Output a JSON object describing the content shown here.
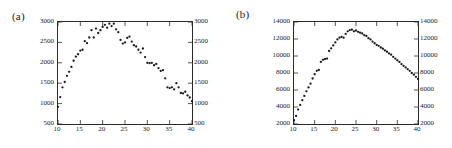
{
  "figure": {
    "background": "#ffffff",
    "point_color": "#1a1a1a",
    "axis_color": "#2b2b2b"
  },
  "panels": [
    {
      "id": "a",
      "label": "(a)"
    },
    {
      "id": "b",
      "label": "(b)"
    }
  ],
  "chart_data": [
    {
      "type": "scatter",
      "title": "(a)",
      "xlabel": "",
      "ylabel": "",
      "xlim": [
        10,
        40
      ],
      "ylim": [
        500,
        3000
      ],
      "xticks": [
        10,
        15,
        20,
        25,
        30,
        35,
        40
      ],
      "yticks": [
        500,
        1000,
        1500,
        2000,
        2500,
        3000
      ],
      "xticklabels": [
        "10",
        "15",
        "20",
        "25",
        "30",
        "35",
        "40"
      ],
      "yticklabels": [
        "500",
        "1000",
        "1500",
        "2000",
        "2500",
        "3000"
      ],
      "grid": false,
      "legend": null,
      "mirrored_y_axis": true,
      "marker": "filled-circle",
      "x": [
        10.0,
        10.5,
        11.0,
        11.5,
        12.0,
        12.5,
        13.0,
        13.5,
        14.0,
        14.5,
        15.0,
        15.5,
        16.0,
        16.5,
        17.0,
        17.5,
        18.0,
        18.5,
        19.0,
        19.5,
        20.0,
        20.5,
        21.0,
        21.5,
        22.0,
        22.5,
        23.0,
        23.5,
        24.0,
        24.5,
        25.0,
        25.5,
        26.0,
        26.5,
        27.0,
        27.5,
        28.0,
        28.5,
        29.0,
        29.5,
        30.0,
        30.5,
        31.0,
        31.5,
        32.0,
        32.5,
        33.0,
        33.5,
        34.0,
        34.5,
        35.0,
        35.5,
        36.0,
        36.5,
        37.0,
        37.5,
        38.0,
        38.5,
        39.0,
        39.5,
        40.0
      ],
      "y": [
        920,
        1160,
        1400,
        1530,
        1680,
        1780,
        1900,
        2050,
        2150,
        2210,
        2300,
        2320,
        2530,
        2480,
        2620,
        2800,
        2620,
        2840,
        2730,
        2800,
        2880,
        2930,
        2860,
        2960,
        2900,
        2960,
        2820,
        2750,
        2560,
        2470,
        2500,
        2610,
        2640,
        2520,
        2430,
        2400,
        2320,
        2250,
        2350,
        2140,
        2000,
        1990,
        2000,
        1940,
        1970,
        1870,
        1800,
        1820,
        1620,
        1400,
        1380,
        1400,
        1350,
        1500,
        1400,
        1260,
        1250,
        1290,
        1200,
        1150,
        1060
      ]
    },
    {
      "type": "scatter",
      "title": "(b)",
      "xlabel": "",
      "ylabel": "",
      "xlim": [
        10,
        40
      ],
      "ylim": [
        2000,
        14000
      ],
      "xticks": [
        10,
        15,
        20,
        25,
        30,
        35,
        40
      ],
      "yticks": [
        2000,
        4000,
        6000,
        8000,
        10000,
        12000,
        14000
      ],
      "xticklabels": [
        "10",
        "15",
        "20",
        "25",
        "30",
        "35",
        "40"
      ],
      "yticklabels": [
        "2000",
        "4000",
        "6000",
        "8000",
        "10000",
        "12000",
        "14000"
      ],
      "grid": false,
      "legend": null,
      "mirrored_y_axis": true,
      "marker": "filled-circle",
      "x": [
        10.0,
        10.5,
        11.0,
        11.5,
        12.0,
        12.5,
        13.0,
        13.5,
        14.0,
        14.5,
        15.0,
        15.5,
        16.0,
        16.5,
        17.0,
        17.5,
        18.0,
        18.5,
        19.0,
        19.5,
        20.0,
        20.5,
        21.0,
        21.5,
        22.0,
        22.5,
        23.0,
        23.5,
        24.0,
        24.5,
        25.0,
        25.5,
        26.0,
        26.5,
        27.0,
        27.5,
        28.0,
        28.5,
        29.0,
        29.5,
        30.0,
        30.5,
        31.0,
        31.5,
        32.0,
        32.5,
        33.0,
        33.5,
        34.0,
        34.5,
        35.0,
        35.5,
        36.0,
        36.5,
        37.0,
        37.5,
        38.0,
        38.5,
        39.0,
        39.5,
        40.0
      ],
      "y": [
        2450,
        2950,
        3700,
        4250,
        4800,
        5300,
        5850,
        6300,
        6750,
        7350,
        7850,
        8250,
        8350,
        9300,
        9550,
        9650,
        9700,
        10600,
        10900,
        11250,
        11600,
        11950,
        12150,
        12250,
        12150,
        12600,
        12900,
        13050,
        13100,
        12900,
        13000,
        12850,
        12750,
        12650,
        12450,
        12350,
        12100,
        11950,
        11700,
        11500,
        11300,
        11200,
        11000,
        10850,
        10650,
        10500,
        10300,
        10150,
        9900,
        9700,
        9500,
        9300,
        9050,
        8850,
        8650,
        8450,
        8250,
        8000,
        7800,
        7550,
        7300
      ]
    }
  ]
}
